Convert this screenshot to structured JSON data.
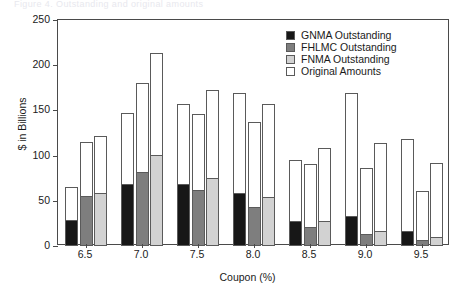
{
  "figure": {
    "clipped_title": "Figure 4.  Outstanding and original amounts",
    "ylabel": "$ in Billions",
    "xlabel": "Coupon (%)"
  },
  "legend": {
    "position": "top-right",
    "items": [
      {
        "label": "GNMA Outstanding",
        "color": "#171717",
        "key": "gnma"
      },
      {
        "label": "FHLMC Outstanding",
        "color": "#7e7e7e",
        "key": "fhlmc"
      },
      {
        "label": "FNMA Outstanding",
        "color": "#d2d2d2",
        "key": "fnma"
      },
      {
        "label": "Original Amounts",
        "color": "#ffffff",
        "key": "orig"
      }
    ]
  },
  "axes": {
    "y_ticks": [
      0,
      50,
      100,
      150,
      200,
      250
    ],
    "y_tick_labels": [
      "0",
      "50",
      "100",
      "150",
      "200",
      "250"
    ],
    "ylim": [
      0,
      250
    ],
    "x_tick_labels": [
      "6.5",
      "7.0",
      "7.5",
      "8.0",
      "8.5",
      "9.0",
      "9.5"
    ],
    "grid": false
  },
  "chart_data": {
    "type": "bar",
    "title": "",
    "xlabel": "Coupon (%)",
    "ylabel": "$ in Billions",
    "ylim": [
      0,
      250
    ],
    "grid": false,
    "legend_position": "top-right",
    "categories": [
      "6.5",
      "7.0",
      "7.5",
      "8.0",
      "8.5",
      "9.0",
      "9.5"
    ],
    "note": "Each coupon group has three bars (GNMA, FHLMC, FNMA). Each bar's full height is the Original Amount; the shaded lower portion is the Outstanding amount.",
    "series": [
      {
        "name": "GNMA Original",
        "key": "gnma_original",
        "values": [
          65,
          147,
          157,
          169,
          95,
          169,
          118
        ]
      },
      {
        "name": "GNMA Outstanding",
        "key": "gnma_out",
        "values": [
          28,
          68,
          67,
          58,
          27,
          32,
          16
        ]
      },
      {
        "name": "FHLMC Original",
        "key": "fhlmc_original",
        "values": [
          115,
          180,
          146,
          137,
          91,
          86,
          61
        ]
      },
      {
        "name": "FHLMC Outstanding",
        "key": "fhlmc_out",
        "values": [
          54,
          81,
          61,
          42,
          20,
          12,
          6
        ]
      },
      {
        "name": "FNMA Original",
        "key": "fnma_original",
        "values": [
          122,
          214,
          173,
          157,
          108,
          114,
          92
        ]
      },
      {
        "name": "FNMA Outstanding",
        "key": "fnma_out",
        "values": [
          58,
          100,
          74,
          53,
          27,
          16,
          9
        ]
      }
    ],
    "groups": [
      {
        "category": "6.5",
        "bars": [
          {
            "agency": "GNMA",
            "original": 65,
            "outstanding": 28
          },
          {
            "agency": "FHLMC",
            "original": 115,
            "outstanding": 54
          },
          {
            "agency": "FNMA",
            "original": 122,
            "outstanding": 58
          }
        ]
      },
      {
        "category": "7.0",
        "bars": [
          {
            "agency": "GNMA",
            "original": 147,
            "outstanding": 68
          },
          {
            "agency": "FHLMC",
            "original": 180,
            "outstanding": 81
          },
          {
            "agency": "FNMA",
            "original": 214,
            "outstanding": 100
          }
        ]
      },
      {
        "category": "7.5",
        "bars": [
          {
            "agency": "GNMA",
            "original": 157,
            "outstanding": 67
          },
          {
            "agency": "FHLMC",
            "original": 146,
            "outstanding": 61
          },
          {
            "agency": "FNMA",
            "original": 173,
            "outstanding": 74
          }
        ]
      },
      {
        "category": "8.0",
        "bars": [
          {
            "agency": "GNMA",
            "original": 169,
            "outstanding": 58
          },
          {
            "agency": "FHLMC",
            "original": 137,
            "outstanding": 42
          },
          {
            "agency": "FNMA",
            "original": 157,
            "outstanding": 53
          }
        ]
      },
      {
        "category": "8.5",
        "bars": [
          {
            "agency": "GNMA",
            "original": 95,
            "outstanding": 27
          },
          {
            "agency": "FHLMC",
            "original": 91,
            "outstanding": 20
          },
          {
            "agency": "FNMA",
            "original": 108,
            "outstanding": 27
          }
        ]
      },
      {
        "category": "9.0",
        "bars": [
          {
            "agency": "GNMA",
            "original": 169,
            "outstanding": 32
          },
          {
            "agency": "FHLMC",
            "original": 86,
            "outstanding": 12
          },
          {
            "agency": "FNMA",
            "original": 114,
            "outstanding": 16
          }
        ]
      },
      {
        "category": "9.5",
        "bars": [
          {
            "agency": "GNMA",
            "original": 118,
            "outstanding": 16
          },
          {
            "agency": "FHLMC",
            "original": 61,
            "outstanding": 6
          },
          {
            "agency": "FNMA",
            "original": 92,
            "outstanding": 9
          }
        ]
      }
    ]
  }
}
